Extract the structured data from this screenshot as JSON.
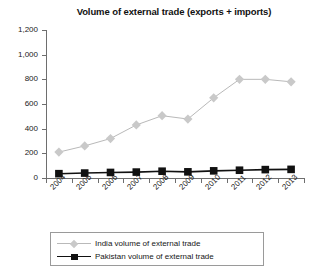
{
  "chart_data": {
    "type": "line",
    "title": "Volume of external trade (exports + imports)",
    "xlabel": "",
    "ylabel": "",
    "ylim": [
      0,
      1200
    ],
    "yticks": [
      "0",
      "200",
      "400",
      "600",
      "800",
      "1,000",
      "1,200"
    ],
    "ytick_values": [
      0,
      200,
      400,
      600,
      800,
      1000,
      1200
    ],
    "grid": false,
    "legend_position": "bottom",
    "categories": [
      "2004",
      "2005",
      "2006",
      "2007",
      "2008",
      "2009",
      "2010",
      "2011",
      "2012",
      "2013"
    ],
    "series": [
      {
        "name": "India volume of external trade",
        "color": "#c9c9c9",
        "line_color": "#b9b9b9",
        "marker": "diamond",
        "values": [
          210,
          260,
          320,
          430,
          505,
          478,
          650,
          800,
          800,
          780
        ]
      },
      {
        "name": "Pakistan volume of external trade",
        "color": "#111111",
        "line_color": "#111111",
        "marker": "square",
        "values": [
          35,
          40,
          45,
          48,
          55,
          50,
          58,
          63,
          68,
          70
        ]
      }
    ]
  },
  "legend": {
    "items": [
      {
        "label": "India volume of external trade"
      },
      {
        "label": "Pakistan volume of external trade"
      }
    ]
  }
}
